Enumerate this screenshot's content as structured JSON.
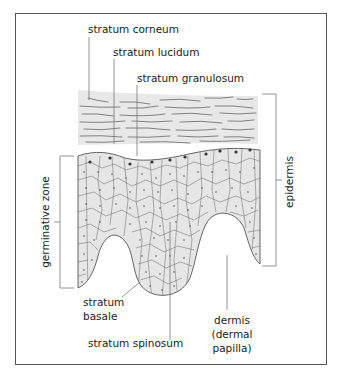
{
  "diagram": {
    "labels": {
      "stratum_corneum": "stratum corneum",
      "stratum_lucidum": "stratum lucidum",
      "stratum_granulosum": "stratum granulosum",
      "epidermis": "epidermis",
      "germinative_zone": "germinative zone",
      "stratum_basale_line1": "stratum",
      "stratum_basale_line2": "basale",
      "stratum_spinosum": "stratum spinosum",
      "dermis_line1": "dermis",
      "dermis_line2": "(dermal",
      "dermis_line3": "papilla)"
    },
    "colors": {
      "cell_fill": "#e6e6e6",
      "corneum_fill": "#e8e8e8",
      "frame": "#555555",
      "lines": "#666666",
      "text": "#222222"
    }
  }
}
